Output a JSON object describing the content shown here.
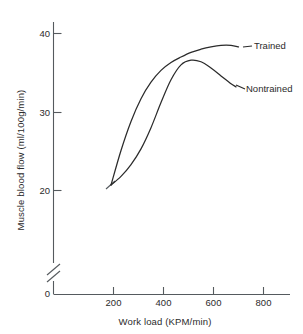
{
  "chart_data": {
    "type": "line",
    "title": "",
    "xlabel": "Work load (KPM/min)",
    "ylabel": "Muscle blood flow (ml/100g/min)",
    "xlim": [
      0,
      860
    ],
    "ylim": [
      0,
      42
    ],
    "grid": false,
    "legend_position": "inline-right-of-curve-ends",
    "xticks": [
      200,
      400,
      600,
      800
    ],
    "xtick_labels": [
      "200",
      "400",
      "600",
      "800"
    ],
    "yticks": [
      0,
      20,
      30,
      40
    ],
    "ytick_labels": [
      "0",
      "20",
      "30",
      "40"
    ],
    "y_axis_break": true,
    "y_axis_break_between": [
      0,
      20
    ],
    "series": [
      {
        "name": "Trained",
        "x": [
          190,
          230,
          270,
          310,
          350,
          390,
          430,
          470,
          510,
          550,
          590,
          630,
          670,
          700
        ],
        "values": [
          20.7,
          25.1,
          28.8,
          31.7,
          33.8,
          35.3,
          36.3,
          37.0,
          37.6,
          38.0,
          38.3,
          38.5,
          38.5,
          38.3
        ]
      },
      {
        "name": "Nontrained",
        "x": [
          190,
          230,
          270,
          310,
          350,
          390,
          430,
          470,
          510,
          550,
          590,
          630,
          670,
          690
        ],
        "values": [
          20.7,
          21.8,
          23.3,
          25.3,
          28.0,
          31.2,
          34.1,
          36.0,
          36.6,
          36.4,
          35.6,
          34.6,
          33.6,
          33.2
        ]
      }
    ]
  },
  "labels": {
    "trained": "Trained",
    "nontrained": "Nontrained",
    "x_axis_title": "Work load (KPM/min)",
    "y_axis_title": "Muscle blood flow (ml/100g/min)",
    "y_40": "40",
    "y_30": "30",
    "y_20": "20",
    "y_0": "0",
    "x_200": "200",
    "x_400": "400",
    "x_600": "600",
    "x_800": "800"
  }
}
